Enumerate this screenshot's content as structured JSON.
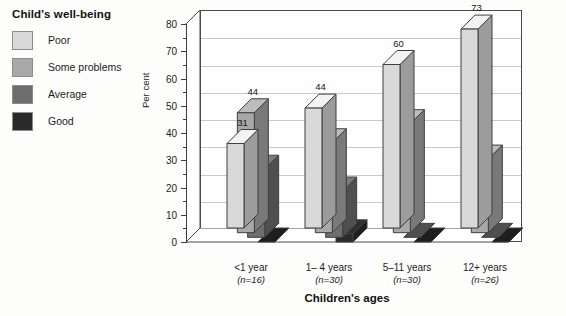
{
  "legend": {
    "title": "Child's well-being",
    "items": [
      {
        "label": "Poor",
        "color": "#d9d9d9"
      },
      {
        "label": "Some problems",
        "color": "#a8a8a8"
      },
      {
        "label": "Average",
        "color": "#6e6e6e"
      },
      {
        "label": "Good",
        "color": "#2a2a2a"
      }
    ]
  },
  "axis": {
    "ylabel": "Per cent",
    "xlabel": "Children's ages",
    "yticks": [
      "0",
      "10",
      "20",
      "30",
      "40",
      "50",
      "60",
      "70",
      "80"
    ]
  },
  "groups": [
    {
      "label": "<1 year",
      "n": "(n=16)"
    },
    {
      "label": "1– 4 years",
      "n": "(n=30)"
    },
    {
      "label": "5–11 years",
      "n": "(n=30)"
    },
    {
      "label": "12+ years",
      "n": "(n=26)"
    }
  ],
  "chart_data": {
    "type": "bar",
    "title": "Child's well-being",
    "xlabel": "Children's ages",
    "ylabel": "Per cent",
    "ylim": [
      0,
      80
    ],
    "ytick_step": 10,
    "grid": true,
    "legend_position": "top-left-outside",
    "style": "3d-grouped-columns",
    "categories": [
      "<1 year",
      "1– 4 years",
      "5–11 years",
      "12+ years"
    ],
    "sample_sizes": [
      "(n=16)",
      "(n=30)",
      "(n=30)",
      "(n=26)"
    ],
    "series": [
      {
        "name": "Poor",
        "color": "#d9d9d9",
        "values": [
          31,
          44,
          60,
          73
        ],
        "labels": [
          "31",
          "44",
          "60",
          "73"
        ]
      },
      {
        "name": "Some problems",
        "color": "#a8a8a8",
        "values": [
          44,
          33,
          40,
          27
        ],
        "labels": [
          "44",
          "33",
          "40",
          "27"
        ]
      },
      {
        "name": "Average",
        "color": "#6e6e6e",
        "values": [
          25,
          17,
          0,
          0
        ],
        "labels": [
          "25",
          "17",
          "",
          ""
        ]
      },
      {
        "name": "Good",
        "color": "#2a2a2a",
        "values": [
          0,
          3,
          0,
          0
        ],
        "labels": [
          "",
          "3",
          "",
          ""
        ]
      }
    ]
  }
}
